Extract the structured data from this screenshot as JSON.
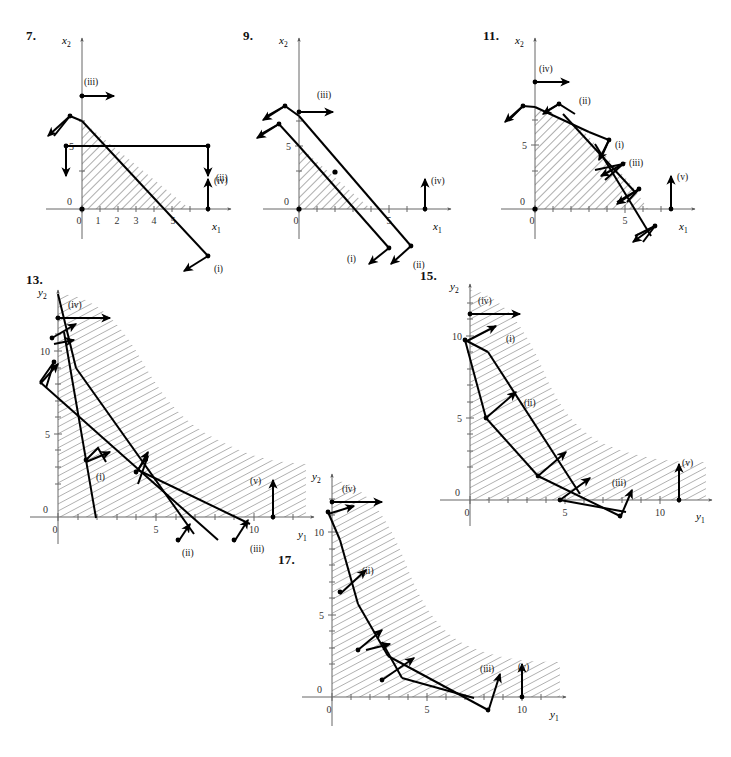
{
  "figure": {
    "kind": "linear-programming-feasible-regions",
    "panel_count": 6,
    "hatch_color": "#555555",
    "line_color": "#000000",
    "axis_color": "#555555"
  },
  "panels": [
    {
      "id": "p7",
      "number": "7.",
      "xaxis_label": "x",
      "xaxis_sub": "1",
      "yaxis_label": "x",
      "yaxis_sub": "2",
      "x_ticks": [
        "0",
        "1",
        "2",
        "3",
        "4",
        "5"
      ],
      "x_tick_values": [
        0,
        1,
        2,
        3,
        4,
        5
      ],
      "y_ticks": [
        "0",
        "5"
      ],
      "y_tick_values": [
        0,
        5
      ],
      "vectors": [
        {
          "name": "(i)",
          "label": "(i)"
        },
        {
          "name": "(ii)",
          "label": "(ii)"
        },
        {
          "name": "(iii)",
          "label": "(iii)"
        },
        {
          "name": "(iv)",
          "label": "(iv)"
        }
      ],
      "region": "triangle bounded by axes and line through (0,7) and (6,0)"
    },
    {
      "id": "p9",
      "number": "9.",
      "xaxis_label": "x",
      "xaxis_sub": "1",
      "yaxis_label": "x",
      "yaxis_sub": "2",
      "x_ticks": [
        "0",
        "5"
      ],
      "x_tick_values": [
        0,
        5
      ],
      "y_ticks": [
        "0",
        "5"
      ],
      "y_tick_values": [
        0,
        5
      ],
      "vectors": [
        {
          "name": "(i)",
          "label": "(i)"
        },
        {
          "name": "(ii)",
          "label": "(ii)"
        },
        {
          "name": "(iii)",
          "label": "(iii)"
        },
        {
          "name": "(iv)",
          "label": "(iv)"
        }
      ],
      "region": "triangle bounded by axes, line (0,5)-(4,0) and line (0,7)-(4.2,0)"
    },
    {
      "id": "p11",
      "number": "11.",
      "xaxis_label": "x",
      "xaxis_sub": "1",
      "yaxis_label": "x",
      "yaxis_sub": "2",
      "x_ticks": [
        "0",
        "5"
      ],
      "x_tick_values": [
        0,
        5
      ],
      "y_ticks": [
        "0",
        "5"
      ],
      "y_tick_values": [
        0,
        5
      ],
      "vectors": [
        {
          "name": "(i)",
          "label": "(i)"
        },
        {
          "name": "(ii)",
          "label": "(ii)"
        },
        {
          "name": "(iii)",
          "label": "(iii)"
        },
        {
          "name": "(iv)",
          "label": "(iv)"
        },
        {
          "name": "(v)",
          "label": "(v)"
        }
      ],
      "region": "polygon bounded by axes and piecewise boundary (0,8)-(2.5,6.2)-(5.2,2)-(6.2,0)"
    },
    {
      "id": "p13",
      "number": "13.",
      "xaxis_label": "y",
      "xaxis_sub": "1",
      "yaxis_label": "y",
      "yaxis_sub": "2",
      "x_ticks": [
        "0",
        "5",
        "10"
      ],
      "x_tick_values": [
        0,
        5,
        10
      ],
      "y_ticks": [
        "0",
        "5",
        "10"
      ],
      "y_tick_values": [
        0,
        5,
        10
      ],
      "vectors": [
        {
          "name": "(i)",
          "label": "(i)"
        },
        {
          "name": "(ii)",
          "label": "(ii)"
        },
        {
          "name": "(iii)",
          "label": "(iii)"
        },
        {
          "name": "(iv)",
          "label": "(iv)"
        },
        {
          "name": "(v)",
          "label": "(v)"
        }
      ],
      "region": "unbounded convex region above decreasing S-curve from (0,12) to (13,1)"
    },
    {
      "id": "p15",
      "number": "15.",
      "xaxis_label": "y",
      "xaxis_sub": "1",
      "yaxis_label": "y",
      "yaxis_sub": "2",
      "x_ticks": [
        "0",
        "5",
        "10"
      ],
      "x_tick_values": [
        0,
        5,
        10
      ],
      "y_ticks": [
        "0",
        "5",
        "10"
      ],
      "y_tick_values": [
        0,
        5,
        10
      ],
      "vectors": [
        {
          "name": "(i)",
          "label": "(i)"
        },
        {
          "name": "(ii)",
          "label": "(ii)"
        },
        {
          "name": "(iii)",
          "label": "(iii)"
        },
        {
          "name": "(iv)",
          "label": "(iv)"
        },
        {
          "name": "(v)",
          "label": "(v)"
        }
      ],
      "region": "unbounded convex region above decreasing curve from (0,13) to (13,1)"
    },
    {
      "id": "p17",
      "number": "17.",
      "xaxis_label": "y",
      "xaxis_sub": "1",
      "yaxis_label": "y",
      "yaxis_sub": "2",
      "x_ticks": [
        "0",
        "5",
        "10"
      ],
      "x_tick_values": [
        0,
        5,
        10
      ],
      "y_ticks": [
        "0",
        "5",
        "10"
      ],
      "y_tick_values": [
        0,
        5,
        10
      ],
      "vectors": [
        {
          "name": "(ii)",
          "label": "(ii)"
        },
        {
          "name": "(iii)",
          "label": "(iii)"
        },
        {
          "name": "(iv)",
          "label": "(iv)"
        },
        {
          "name": "(v)",
          "label": "(v)"
        }
      ],
      "region": "unbounded convex region above decreasing curve from (0,12) to (12,1)"
    }
  ]
}
